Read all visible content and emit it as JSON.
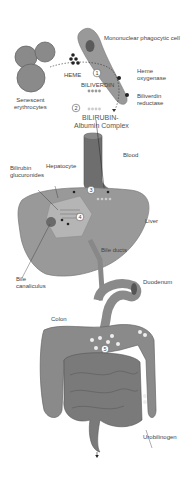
{
  "diagram": {
    "colors": {
      "organ": "#8a8a8a",
      "organ_dark": "#6a6a6a",
      "liver": "#999999",
      "hepatocyte": "#b5b5b5",
      "line": "#333333",
      "dot_light": "#bbbbbb",
      "dot_dark": "#777777"
    },
    "labels": {
      "phagocyte": "Mononuclear phagocytic cell",
      "heme": "HEME",
      "heme_oxygenase_1": "Heme",
      "heme_oxygenase_2": "oxygenase",
      "biliverdin_reductase_1": "Biliverdin",
      "biliverdin_reductase_2": "reductase",
      "biliverdin": "BILIVERDIN",
      "senescent_1": "Senescent",
      "senescent_2": "erythrocytes",
      "complex_1": "BILIRUBIN-",
      "complex_2": "Albumin Complex",
      "blood": "Blood",
      "bilirubin_gluc_1": "Bilirubin",
      "bilirubin_gluc_2": "glucuronides",
      "hepatocyte": "Hepatocyte",
      "liver": "Liver",
      "bile_ducts": "Bile ducts",
      "bile_can_1": "Bile",
      "bile_can_2": "canaliculus",
      "duodenum": "Duodenum",
      "colon": "Colon",
      "urobilinogen": "Urobilinogen"
    },
    "steps": [
      "1",
      "2",
      "3",
      "4",
      "5"
    ]
  }
}
